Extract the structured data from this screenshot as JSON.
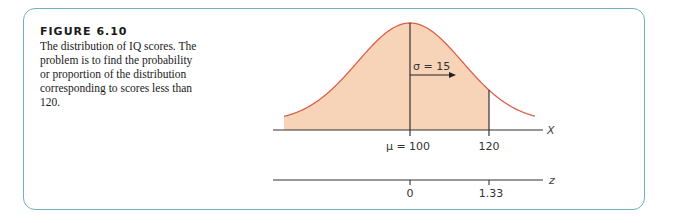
{
  "figure": {
    "title": "FIGURE 6.10",
    "caption": "The distribution of IQ scores. The problem is to find the probability or proportion of the distribution corresponding to scores less than 120."
  },
  "colors": {
    "frame": "#6fb3b3",
    "fill": "#f7d3b8",
    "curve": "#d9604a",
    "axis": "#333333"
  },
  "chart_data": {
    "type": "area",
    "title": "The distribution of IQ scores",
    "distribution": "normal",
    "mean": 100,
    "sd": 15,
    "shaded_region": {
      "from": "-inf",
      "to": 120
    },
    "x_axis": {
      "label": "X",
      "ticks": [
        {
          "value": 100,
          "label": "μ = 100"
        },
        {
          "value": 120,
          "label": "120"
        }
      ]
    },
    "z_axis": {
      "label": "z",
      "ticks": [
        {
          "value": 0,
          "label": "0"
        },
        {
          "value": 1.33,
          "label": "1.33"
        }
      ]
    },
    "annotations": [
      {
        "text": "σ = 15",
        "type": "arrow",
        "from": 100,
        "to": 115
      }
    ],
    "grid": false,
    "legend": null
  },
  "labels": {
    "x_axis_name": "X",
    "z_axis_name": "z",
    "mu_label": "μ = 100",
    "x_120_label": "120",
    "z_0_label": "0",
    "z_133_label": "1.33",
    "sigma_label": "σ = 15"
  }
}
